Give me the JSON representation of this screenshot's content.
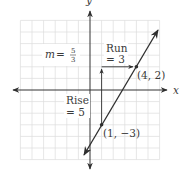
{
  "figure": {
    "axes": {
      "x_label": "x",
      "y_label": "y",
      "range": [
        -6,
        6
      ],
      "grid": true
    },
    "slope_label": {
      "var": "m",
      "eq": "=",
      "numerator": "5",
      "denominator": "3"
    },
    "run_label": {
      "line1": "Run",
      "line2": "= 3"
    },
    "rise_label": {
      "line1": "Rise",
      "line2": "= 5"
    },
    "points": [
      {
        "label": "(4, 2)",
        "x": 4,
        "y": 2
      },
      {
        "label": "(1, −3)",
        "x": 1,
        "y": -3
      }
    ],
    "line": {
      "slope": "5/3",
      "through": [
        [
          1,
          -3
        ],
        [
          4,
          2
        ]
      ]
    },
    "colors": {
      "grid": "#dcdcdc",
      "axis": "#333333",
      "line": "#2e2e2e",
      "text": "#3a3a3a"
    }
  }
}
